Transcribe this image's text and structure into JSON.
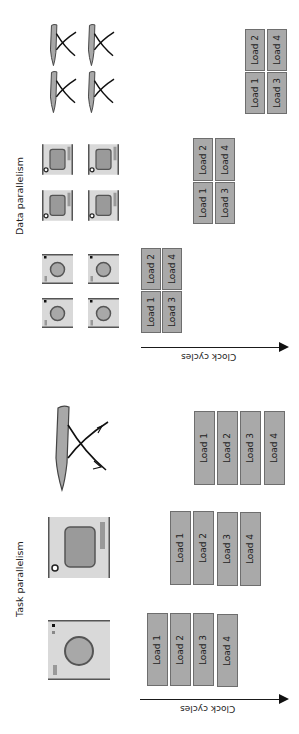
{
  "sections": {
    "task": {
      "title": "Task parallelism"
    },
    "data": {
      "title": "Data parallelism"
    }
  },
  "axis": {
    "label": "Clock cycles"
  },
  "colors": {
    "block_fill": "#a9a9a9",
    "block_border": "#6e6e6e",
    "appliance_body": "#d9d9d9",
    "appliance_dark": "#555555",
    "appliance_mid": "#9a9a9a"
  },
  "icons": {
    "washer": "washing-machine-icon",
    "dryer": "dryer-icon",
    "iron": "iron-icon"
  },
  "task_parallelism": {
    "stages": [
      {
        "appliance": "washer",
        "loads": [
          "Load 1",
          "Load 2",
          "Load 3",
          "Load 4"
        ]
      },
      {
        "appliance": "dryer",
        "loads": [
          "Load 1",
          "Load 2",
          "Load 3",
          "Load 4"
        ]
      },
      {
        "appliance": "iron",
        "loads": [
          "Load 1",
          "Load 2",
          "Load 3",
          "Load 4"
        ]
      }
    ]
  },
  "data_parallelism": {
    "stages": [
      {
        "appliance": "washer",
        "count": 4,
        "loads": [
          "Load 1",
          "Load 2",
          "Load 3",
          "Load 4"
        ]
      },
      {
        "appliance": "dryer",
        "count": 4,
        "loads": [
          "Load 1",
          "Load 2",
          "Load 3",
          "Load 4"
        ]
      },
      {
        "appliance": "iron",
        "count": 4,
        "loads": [
          "Load 1",
          "Load 2",
          "Load 3",
          "Load 4"
        ]
      }
    ]
  }
}
